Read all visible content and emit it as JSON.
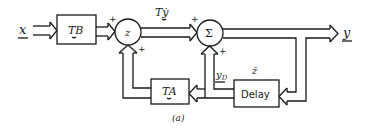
{
  "figure": {
    "caption": "(a)",
    "inputs": {
      "x_label": "x"
    },
    "outputs": {
      "y_label": "y"
    },
    "blocks": {
      "tb": {
        "label": "TB"
      },
      "ta": {
        "label": "TA"
      },
      "delay": {
        "label": "Delay"
      }
    },
    "junctions": {
      "z_node": {
        "label": "z",
        "signs": [
          "+",
          "+"
        ]
      },
      "sum_node": {
        "label": "Σ",
        "signs": [
          "+",
          "+"
        ]
      }
    },
    "signals": {
      "t_ydot": "Tẏ",
      "y_d": "y",
      "y_d_sub": "D",
      "z_bar": "z̄"
    },
    "plus": "+"
  }
}
